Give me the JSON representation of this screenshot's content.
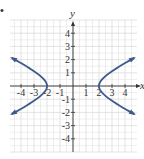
{
  "bullet": "•",
  "chart_data": {
    "type": "line",
    "title": "",
    "xlabel": "x",
    "ylabel": "y",
    "xlim": [
      -4.8,
      4.8
    ],
    "ylim": [
      -5,
      5
    ],
    "grid": true,
    "x_ticks": [
      "-4",
      "-3",
      "-2",
      "-1",
      "1",
      "2",
      "3",
      "4"
    ],
    "x_tick_values": [
      -4,
      -3,
      -2,
      -1,
      1,
      2,
      3,
      4
    ],
    "y_ticks": [
      "4",
      "3",
      "2",
      "1",
      "-1",
      "-2",
      "-3",
      "-4"
    ],
    "y_tick_values": [
      4,
      3,
      2,
      1,
      -1,
      -2,
      -3,
      -4
    ],
    "equation": "x^2/4 - y^2 = 1",
    "series": [
      {
        "name": "right branch",
        "vertex": [
          2,
          0
        ],
        "x": [
          2,
          2.5,
          3,
          3.5,
          4,
          4.6
        ],
        "y_upper": [
          0,
          0.75,
          1.12,
          1.44,
          1.73,
          2.07
        ],
        "y_lower": [
          0,
          -0.75,
          -1.12,
          -1.44,
          -1.73,
          -2.07
        ]
      },
      {
        "name": "left branch",
        "vertex": [
          -2,
          0
        ],
        "x": [
          -2,
          -2.5,
          -3,
          -3.5,
          -4,
          -4.6
        ],
        "y_upper": [
          0,
          0.75,
          1.12,
          1.44,
          1.73,
          2.07
        ],
        "y_lower": [
          0,
          -0.75,
          -1.12,
          -1.44,
          -1.73,
          -2.07
        ]
      }
    ],
    "curve_color": "#3d5a8a",
    "grid_color": "#dcdcdc",
    "axis_color": "#333333"
  }
}
